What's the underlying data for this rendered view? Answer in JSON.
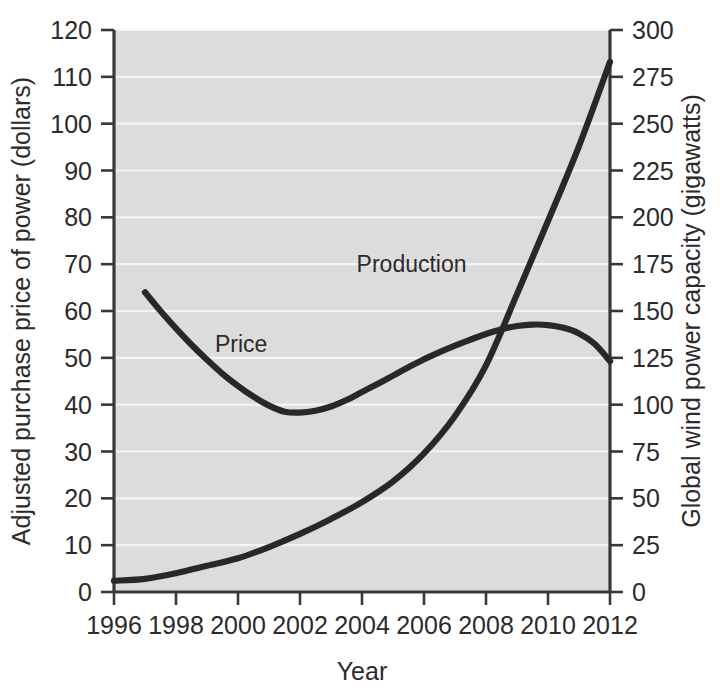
{
  "chart_data": {
    "type": "line",
    "title": "",
    "subtitle": "",
    "xlabel": "Year",
    "ylabel": "Adjusted purchase price of power (dollars)",
    "y2label": "Global wind power capacity (gigawatts)",
    "xlim": [
      1996,
      2012
    ],
    "ylim": [
      0,
      120
    ],
    "y2lim": [
      0,
      300
    ],
    "xticks": [
      1996,
      1998,
      2000,
      2002,
      2004,
      2006,
      2008,
      2010,
      2012
    ],
    "xtick_labels": [
      "1996",
      "1998",
      "2000",
      "2002",
      "2004",
      "2006",
      "2008",
      "2010",
      "2012"
    ],
    "yticks": [
      0,
      10,
      20,
      30,
      40,
      50,
      60,
      70,
      80,
      90,
      100,
      110,
      120
    ],
    "ytick_labels": [
      "0",
      "10",
      "20",
      "30",
      "40",
      "50",
      "60",
      "70",
      "80",
      "90",
      "100",
      "110",
      "120"
    ],
    "y2ticks": [
      0,
      25,
      50,
      75,
      100,
      125,
      150,
      175,
      200,
      225,
      250,
      275,
      300
    ],
    "y2tick_labels": [
      "0",
      "25",
      "50",
      "75",
      "100",
      "125",
      "150",
      "175",
      "200",
      "225",
      "250",
      "275",
      "300"
    ],
    "grid": true,
    "grid_orientation": "horizontal",
    "legend": "inline-annotations",
    "plot_background": "#dcdcdc",
    "gridline_color": "#f4f4f4",
    "curve_color": "#2b2728",
    "series": [
      {
        "name": "Price",
        "axis": "left",
        "units": "dollars",
        "annotation": "Price",
        "annotation_x": 2000.1,
        "annotation_y": 53,
        "x": [
          1997.0,
          1997.5,
          1998.0,
          1998.5,
          1999.0,
          1999.5,
          2000.0,
          2000.5,
          2001.0,
          2001.5,
          2002.0,
          2002.5,
          2003.0,
          2003.5,
          2004.0,
          2004.5,
          2005.0,
          2005.5,
          2006.0,
          2006.5,
          2007.0,
          2007.5,
          2008.0,
          2008.5,
          2009.0,
          2009.5,
          2010.0,
          2010.5,
          2011.0,
          2011.5,
          2012.0
        ],
        "y": [
          64.0,
          60.0,
          56.3,
          52.8,
          49.6,
          46.6,
          44.0,
          41.7,
          39.8,
          38.5,
          38.3,
          38.7,
          39.6,
          41.0,
          42.7,
          44.4,
          46.2,
          48.0,
          49.7,
          51.2,
          52.6,
          53.9,
          55.1,
          56.1,
          56.8,
          57.1,
          57.0,
          56.4,
          55.2,
          53.0,
          49.3
        ]
      },
      {
        "name": "Production",
        "axis": "right",
        "units": "gigawatts",
        "annotation": "Production",
        "annotation_x": 2005.6,
        "annotation_y": 175,
        "x": [
          1996,
          1997,
          1998,
          1999,
          2000,
          2001,
          2002,
          2003,
          2004,
          2005,
          2006,
          2007,
          2008,
          2009,
          2010,
          2011,
          2012
        ],
        "y": [
          6,
          7,
          10,
          14,
          18,
          24,
          31,
          39,
          48,
          59,
          74,
          94,
          121,
          159,
          198,
          238,
          283
        ]
      }
    ]
  },
  "axes": {
    "plot_left_px": 114,
    "plot_right_px": 610,
    "plot_top_px": 30,
    "plot_bottom_px": 592
  }
}
